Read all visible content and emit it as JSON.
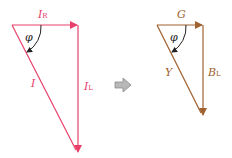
{
  "colors": {
    "current": "#e8406a",
    "admittance": "#a0622f",
    "arrow_fill": "#b8b8b8",
    "arrow_stroke": "#8a8a8a",
    "angle_arc": "#222222"
  },
  "left_triangle": {
    "horizontal_label": "I",
    "horizontal_sub": "R",
    "vertical_label": "I",
    "vertical_sub": "L",
    "hypotenuse_label": "I",
    "angle_label": "φ"
  },
  "right_triangle": {
    "horizontal_label": "G",
    "vertical_label": "B",
    "vertical_sub": "L",
    "hypotenuse_label": "Y",
    "angle_label": "φ"
  },
  "transform_arrow": "⇨"
}
